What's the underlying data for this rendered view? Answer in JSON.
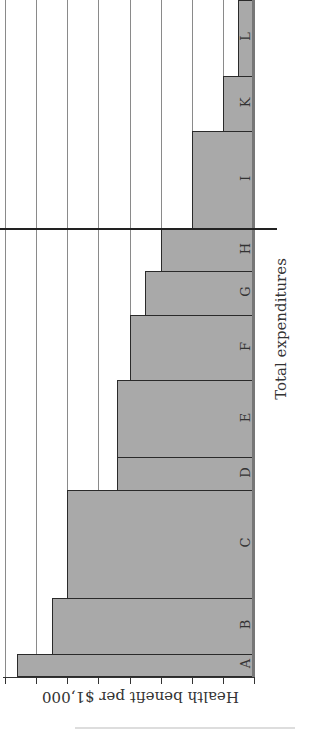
{
  "chart_data": {
    "type": "bar",
    "subtype": "variable-width cost-effectiveness bar chart (rotated 90 degrees)",
    "title": "",
    "xlabel": "Total expenditures",
    "ylabel": "Health benefit per $1,000",
    "categories": [
      "A",
      "B",
      "C",
      "D",
      "E",
      "F",
      "G",
      "H",
      "I",
      "K",
      "L"
    ],
    "values": [
      7.6,
      6.5,
      6.0,
      4.4,
      4.4,
      4.0,
      3.5,
      3.0,
      2.0,
      1.0,
      0.5
    ],
    "widths": [
      22,
      56,
      108,
      33,
      77,
      65,
      44,
      43,
      97,
      55,
      76
    ],
    "ylim": [
      0,
      8
    ],
    "y_ticks": [
      0,
      1,
      2,
      3,
      4,
      5,
      6,
      7,
      8
    ],
    "y_tick_labels_shown": false,
    "grid": true,
    "annotations": [
      "Budget cutoff line between H and I"
    ],
    "legend": null
  },
  "labels": {
    "xlabel": "Total expenditures",
    "ylabel": "Health benefit per $1,000"
  },
  "style": {
    "bar_fill": "#a9a9a9",
    "bar_edge": "#2a2a2a",
    "grid": "#8a8a8a"
  }
}
